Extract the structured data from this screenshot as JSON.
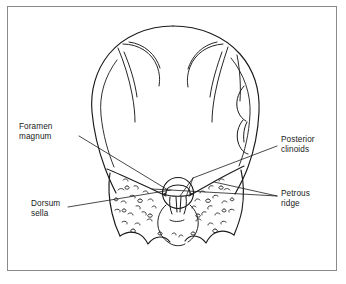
{
  "figure": {
    "background_color": "#ffffff",
    "ink_color": "#1a1a1a",
    "frame_color": "#8a8a8a"
  },
  "labels": {
    "foramen_magnum": "Foramen\nmagnum",
    "dorsum_sella": "Dorsum\nsella",
    "posterior_clinoids": "Posterior\nclinoids",
    "petrous_ridge": "Petrous\nridge"
  },
  "structures": [
    {
      "name": "cranial-vault",
      "description": "rounded skull outline"
    },
    {
      "name": "foramen-magnum",
      "description": "central oval opening at skull base"
    },
    {
      "name": "dorsum-sella",
      "description": "bony shelf seen through foramen magnum"
    },
    {
      "name": "posterior-clinoids",
      "description": "paired projections beside dorsum sella"
    },
    {
      "name": "petrous-ridge-left",
      "description": "left petrous temporal ridge"
    },
    {
      "name": "petrous-ridge-right",
      "description": "right petrous temporal ridge"
    }
  ]
}
